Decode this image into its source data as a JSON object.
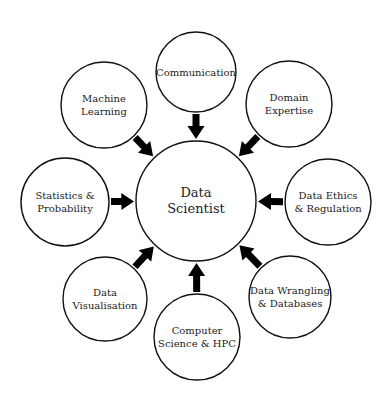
{
  "diagram": {
    "type": "hub-and-spoke",
    "center": {
      "id": "data-scientist",
      "lines": [
        "Data",
        "Scientist"
      ],
      "cx": 196,
      "cy": 201,
      "r": 60
    },
    "nodes": [
      {
        "id": "communication",
        "lines": [
          "Communication"
        ],
        "cx": 196,
        "cy": 72,
        "r": 40
      },
      {
        "id": "domain-expertise",
        "lines": [
          "Domain",
          "Expertise"
        ],
        "cx": 289,
        "cy": 104,
        "r": 43
      },
      {
        "id": "data-ethics-regulation",
        "lines": [
          "Data Ethics",
          "& Regulation"
        ],
        "cx": 328,
        "cy": 202,
        "r": 43
      },
      {
        "id": "data-wrangling-databases",
        "lines": [
          "Data Wrangling",
          "& Databases"
        ],
        "cx": 290,
        "cy": 297,
        "r": 41
      },
      {
        "id": "computer-science-hpc",
        "lines": [
          "Computer",
          "Science & HPC"
        ],
        "cx": 197,
        "cy": 337,
        "r": 43
      },
      {
        "id": "data-visualisation",
        "lines": [
          "Data",
          "Visualisation"
        ],
        "cx": 105,
        "cy": 299,
        "r": 42
      },
      {
        "id": "statistics-probability",
        "lines": [
          "Statistics &",
          "Probability"
        ],
        "cx": 65,
        "cy": 202,
        "r": 44
      },
      {
        "id": "machine-learning",
        "lines": [
          "Machine",
          "Learning"
        ],
        "cx": 104,
        "cy": 105,
        "r": 43
      }
    ],
    "edges_direction": "outer-to-center",
    "colors": {
      "stroke": "#111111",
      "arrow": "#000000",
      "text": "#222222",
      "background": "#ffffff"
    }
  }
}
